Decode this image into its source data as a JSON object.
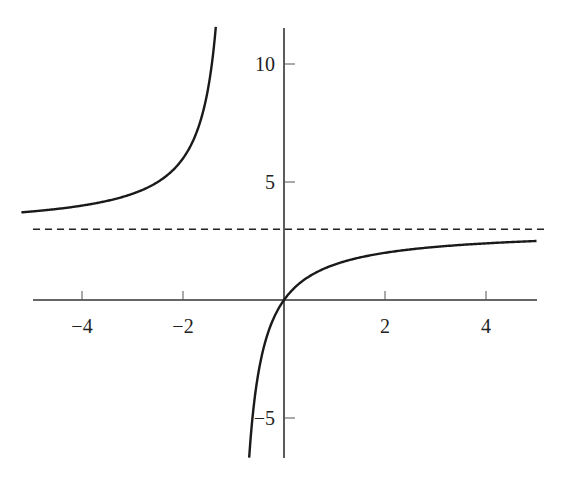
{
  "chart_data": {
    "type": "line",
    "title": "",
    "xlabel": "",
    "ylabel": "",
    "function": "y = 3x/(x+1)",
    "xlim": [
      -5.2,
      5.1
    ],
    "ylim": [
      -6.7,
      11.6
    ],
    "grid": false,
    "legend": null,
    "x_ticks": [
      {
        "value": -4,
        "label": "−4"
      },
      {
        "value": -2,
        "label": "−2"
      },
      {
        "value": 2,
        "label": "2"
      },
      {
        "value": 4,
        "label": "4"
      }
    ],
    "y_ticks": [
      {
        "value": 10,
        "label": "10"
      },
      {
        "value": 5,
        "label": "5"
      },
      {
        "value": -5,
        "label": "−5"
      }
    ],
    "asymptotes": {
      "horizontal": {
        "y": 3,
        "style": "dashed"
      },
      "vertical": {
        "x": -1,
        "drawn": false
      }
    },
    "series": [
      {
        "name": "left-branch",
        "x": [
          -5,
          -4,
          -3,
          -2,
          -1.5,
          -1.35
        ],
        "y": [
          3.75,
          4.0,
          4.5,
          6.0,
          9.0,
          11.57
        ]
      },
      {
        "name": "right-branch",
        "x": [
          -0.69,
          -0.5,
          0,
          1,
          2,
          4,
          5
        ],
        "y": [
          -6.68,
          -3.0,
          0,
          1.5,
          2.0,
          2.4,
          2.5
        ]
      }
    ],
    "colors": {
      "curve": "#1a1a1a",
      "axis": "#333333",
      "dashed": "#222222"
    }
  }
}
